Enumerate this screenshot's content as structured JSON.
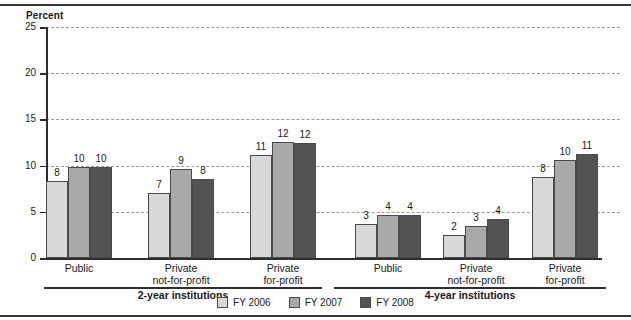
{
  "chart_data": {
    "type": "bar",
    "title": "",
    "xlabel": "",
    "ylabel": "Percent",
    "ylim": [
      0,
      25
    ],
    "yticks": [
      0,
      5,
      10,
      15,
      20,
      25
    ],
    "grid": true,
    "legend_position": "bottom",
    "categories": [
      "Public",
      "Private not-for-profit",
      "Private for-profit",
      "Public",
      "Private not-for-profit",
      "Private for-profit"
    ],
    "category_lines": [
      [
        "Public",
        ""
      ],
      [
        "Private",
        "not-for-profit"
      ],
      [
        "Private",
        "for-profit"
      ],
      [
        "Public",
        ""
      ],
      [
        "Private",
        "not-for-profit"
      ],
      [
        "Private",
        "for-profit"
      ]
    ],
    "groups": [
      {
        "section": "2-year institutions",
        "categories": [
          "Public",
          "Private not-for-profit",
          "Private for-profit"
        ]
      },
      {
        "section": "4-year institutions",
        "categories": [
          "Public",
          "Private not-for-profit",
          "Private for-profit"
        ]
      }
    ],
    "series": [
      {
        "name": "FY 2006",
        "color": "#d8d8d8",
        "values": [
          8,
          7,
          11,
          3,
          2,
          8
        ],
        "labels": [
          "8",
          "7",
          "11",
          "3",
          "2",
          "8"
        ],
        "plot_values": [
          8.3,
          7.0,
          11.2,
          3.7,
          2.5,
          8.8
        ]
      },
      {
        "name": "FY 2007",
        "color": "#a9a9a9",
        "values": [
          10,
          9,
          12,
          4,
          3,
          10
        ],
        "labels": [
          "10",
          "9",
          "12",
          "4",
          "3",
          "10"
        ],
        "plot_values": [
          9.8,
          9.6,
          12.6,
          4.7,
          3.5,
          10.6
        ]
      },
      {
        "name": "FY 2008",
        "color": "#535353",
        "values": [
          10,
          8,
          12,
          4,
          4,
          11
        ],
        "labels": [
          "10",
          "8",
          "12",
          "4",
          "4",
          "11"
        ],
        "plot_values": [
          9.9,
          8.5,
          12.5,
          4.7,
          4.2,
          11.3
        ]
      }
    ],
    "sections": [
      {
        "label": "2-year institutions"
      },
      {
        "label": "4-year institutions"
      }
    ]
  },
  "legend": {
    "items": [
      {
        "label": "FY 2006",
        "color": "#d8d8d8"
      },
      {
        "label": "FY 2007",
        "color": "#a9a9a9"
      },
      {
        "label": "FY 2008",
        "color": "#535353"
      }
    ]
  }
}
